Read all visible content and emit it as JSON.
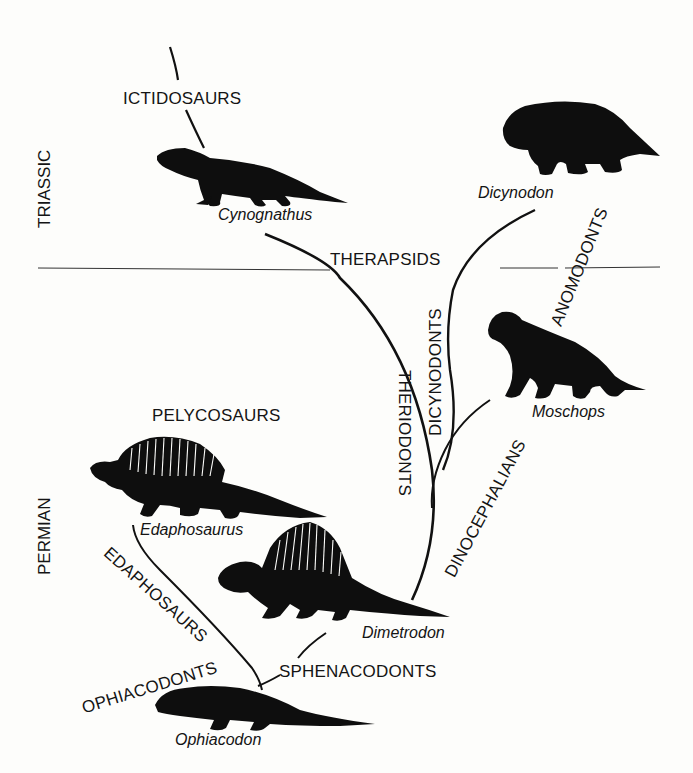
{
  "diagram": {
    "type": "phylogenetic-tree",
    "periods": [
      {
        "label": "TRIASSIC"
      },
      {
        "label": "PERMIAN"
      }
    ],
    "groups": [
      {
        "label": "ICTIDOSAURS"
      },
      {
        "label": "THERAPSIDS"
      },
      {
        "label": "ANOMODONTS"
      },
      {
        "label": "DICYNODONTS"
      },
      {
        "label": "THERIODONTS"
      },
      {
        "label": "DINOCEPHALIANS"
      },
      {
        "label": "PELYCOSAURS"
      },
      {
        "label": "EDAPHOSAURS"
      },
      {
        "label": "OPHIACODONTS"
      },
      {
        "label": "SPHENACODONTS"
      }
    ],
    "species": [
      {
        "name": "Cynognathus"
      },
      {
        "name": "Dicynodon"
      },
      {
        "name": "Moschops"
      },
      {
        "name": "Edaphosaurus"
      },
      {
        "name": "Dimetrodon"
      },
      {
        "name": "Ophiacodon"
      }
    ],
    "colors": {
      "ink": "#141414",
      "background": "#fdfdfb"
    }
  }
}
